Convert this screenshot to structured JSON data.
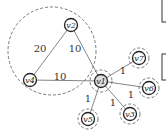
{
  "diagram": {
    "nodes": [
      {
        "id": "v2",
        "label": "v2",
        "x": 71,
        "y": 25,
        "r": 6.5
      },
      {
        "id": "v4",
        "label": "v4",
        "x": 30,
        "y": 80,
        "r": 6.5
      },
      {
        "id": "v1",
        "label": "v1",
        "x": 101,
        "y": 81,
        "r": 6.5
      },
      {
        "id": "v7",
        "label": "v7",
        "x": 139,
        "y": 58,
        "r": 6.5
      },
      {
        "id": "v6",
        "label": "v6",
        "x": 149,
        "y": 88,
        "r": 6.5
      },
      {
        "id": "v3",
        "label": "v3",
        "x": 130,
        "y": 114,
        "r": 6.5
      },
      {
        "id": "v5",
        "label": "v5",
        "x": 88,
        "y": 119,
        "r": 6.5
      }
    ],
    "edges": [
      {
        "from": "v2",
        "to": "v4",
        "weight": "20"
      },
      {
        "from": "v2",
        "to": "v1",
        "weight": "10"
      },
      {
        "from": "v4",
        "to": "v1",
        "weight": "10"
      },
      {
        "from": "v1",
        "to": "v7",
        "weight": "1"
      },
      {
        "from": "v1",
        "to": "v6",
        "weight": "1"
      },
      {
        "from": "v1",
        "to": "v3",
        "weight": "1"
      },
      {
        "from": "v1",
        "to": "v5",
        "weight": "1"
      }
    ],
    "clusters": [
      {
        "name": "large-cluster",
        "cx": 52,
        "cy": 51,
        "r": 44
      },
      {
        "name": "v1-cluster",
        "cx": 101,
        "cy": 81,
        "r": 11
      },
      {
        "name": "v7-cluster",
        "cx": 139,
        "cy": 58,
        "r": 10
      },
      {
        "name": "v6-cluster",
        "cx": 149,
        "cy": 88,
        "r": 10
      },
      {
        "name": "v3-cluster",
        "cx": 130,
        "cy": 114,
        "r": 10
      },
      {
        "name": "v5-cluster",
        "cx": 88,
        "cy": 119,
        "r": 10
      }
    ],
    "weight_labels": [
      {
        "text": "20",
        "x": 40,
        "y": 52
      },
      {
        "text": "10",
        "x": 75,
        "y": 52
      },
      {
        "text": "10",
        "x": 60,
        "y": 80
      },
      {
        "text": "1",
        "x": 123,
        "y": 74
      },
      {
        "text": "1",
        "x": 131,
        "y": 98
      },
      {
        "text": "1",
        "x": 113,
        "y": 106
      },
      {
        "text": "1",
        "x": 88,
        "y": 102
      }
    ]
  }
}
